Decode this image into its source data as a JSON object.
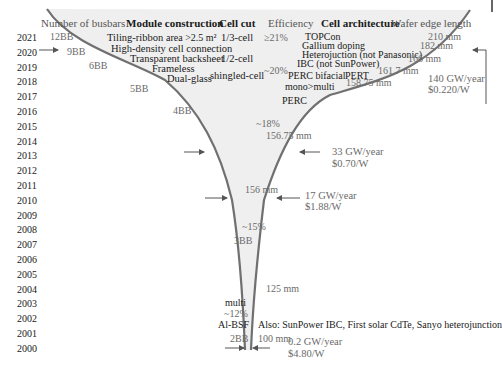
{
  "colors": {
    "funnel_fill": "#efefef",
    "funnel_stroke": "#707070",
    "arrow": "#555555",
    "text_dark": "#1a1a1a",
    "text_gray": "#6a6a6a"
  },
  "years": [
    "2021",
    "2020",
    "2019",
    "2018",
    "2017",
    "2016",
    "2015",
    "2014",
    "2013",
    "2012",
    "2011",
    "2010",
    "2009",
    "2008",
    "2007",
    "2006",
    "2005",
    "2004",
    "2003",
    "2002",
    "2001",
    "2000"
  ],
  "headers": {
    "busbars": "Number of busbars",
    "module": "Module construction",
    "cell_cut": "Cell cut",
    "efficiency": "Efficiency",
    "architecture": "Cell architecture",
    "wafer": "Wafer edge length"
  },
  "busbars": {
    "bb12": "12BB",
    "bb9": "9BB",
    "bb6": "6BB",
    "bb5": "5BB",
    "bb4": "4BB",
    "bb3": "3BB",
    "bb2": "2BB"
  },
  "module": {
    "tiling": "Tiling-ribbon",
    "area": "area >2.5 m²",
    "hdcc": "High-density cell connection",
    "transparent": "Transparent backsheet",
    "frameless": "Frameless",
    "dualglass": "Dual-glass"
  },
  "cell_cut": {
    "third": "1/3-cell",
    "half": "1/2-cell",
    "shingled": "shingled-cell"
  },
  "efficiency": {
    "e21": "≥21%",
    "e20": "~20%",
    "e18": "~18%",
    "e15": "~15%",
    "e12": "~12%"
  },
  "architecture": {
    "topcon": "TOPCon",
    "gallium": "Gallium doping",
    "hetero": "Heterojuction (not Panasonic)",
    "ibc": "IBC (not SunPower)",
    "perc_bifacial": "PERC bifacial",
    "pert": "PERT",
    "mono_multi": "mono>multi",
    "perc": "PERC",
    "multi": "multi",
    "albsf": "Al-BSF",
    "also": "Also: SunPower IBC, First solar CdTe, Sanyo heterojunction"
  },
  "wafer": {
    "w210": "210 mm",
    "w182": "182 mm",
    "w166": "166 mm",
    "w161": "161.7 mm",
    "w158": "158.75 mm",
    "w156_75": "156.75 mm",
    "w156": "156 mm",
    "w125": "125 mm",
    "w100": "100 mm"
  },
  "market": {
    "m2020_vol": "140 GW/year",
    "m2020_price": "$0.220/W",
    "m2013_vol": "33 GW/year",
    "m2013_price": "$0.70/W",
    "m2010_vol": "17 GW/year",
    "m2010_price": "$1.88/W",
    "m2000_vol": "0.2 GW/year",
    "m2000_price": "$4.80/W"
  }
}
